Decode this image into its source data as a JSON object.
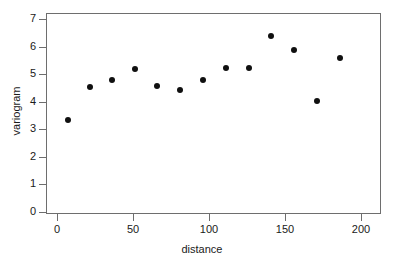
{
  "chart_data": {
    "type": "scatter",
    "title": "",
    "xlabel": "distance",
    "ylabel": "variogram",
    "xlim": [
      -7,
      213
    ],
    "ylim": [
      -0.25,
      7.3
    ],
    "xticks": [
      0,
      50,
      100,
      150,
      200
    ],
    "yticks": [
      0,
      1,
      2,
      3,
      4,
      5,
      6,
      7
    ],
    "xtick_labels": [
      "0",
      "50",
      "100",
      "150",
      "200"
    ],
    "ytick_labels": [
      "0",
      "1",
      "2",
      "3",
      "4",
      "5",
      "6",
      "7"
    ],
    "grid": false,
    "legend": null,
    "marker": "filled-circle",
    "marker_color": "#101010",
    "frame_color": "#6e6e6e",
    "background": "#ffffff",
    "series": [
      {
        "name": "variogram",
        "x": [
          7,
          22,
          36,
          51,
          66,
          81,
          96,
          111,
          126,
          141,
          156,
          171,
          186
        ],
        "y": [
          3.33,
          4.55,
          4.79,
          5.17,
          4.56,
          4.42,
          4.8,
          5.23,
          5.24,
          6.38,
          5.87,
          4.02,
          5.57
        ]
      }
    ],
    "points": [
      {
        "x": 7,
        "y": 3.33
      },
      {
        "x": 22,
        "y": 4.55
      },
      {
        "x": 36,
        "y": 4.79
      },
      {
        "x": 51,
        "y": 5.17
      },
      {
        "x": 66,
        "y": 4.56
      },
      {
        "x": 81,
        "y": 4.42
      },
      {
        "x": 96,
        "y": 4.8
      },
      {
        "x": 111,
        "y": 5.23
      },
      {
        "x": 126,
        "y": 5.24
      },
      {
        "x": 141,
        "y": 6.38
      },
      {
        "x": 156,
        "y": 5.87
      },
      {
        "x": 171,
        "y": 4.02
      },
      {
        "x": 186,
        "y": 5.57
      }
    ]
  }
}
